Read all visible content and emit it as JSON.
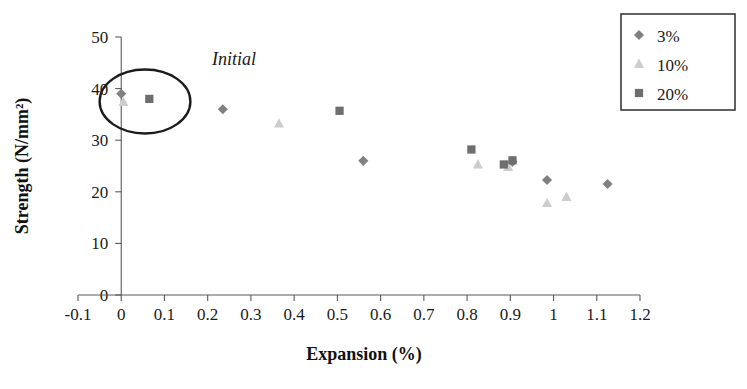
{
  "chart_data": {
    "type": "scatter",
    "title": "",
    "xlabel": "Expansion (%)",
    "ylabel": "Strength (N/mm²)",
    "xlim": [
      -0.1,
      1.2
    ],
    "ylim": [
      0,
      50
    ],
    "xticks": [
      "-0.1",
      "0",
      "0.1",
      "0.2",
      "0.3",
      "0.4",
      "0.5",
      "0.6",
      "0.7",
      "0.8",
      "0.9",
      "1",
      "1.1",
      "1.2"
    ],
    "xtick_values": [
      -0.1,
      0,
      0.1,
      0.2,
      0.3,
      0.4,
      0.5,
      0.6,
      0.7,
      0.8,
      0.9,
      1.0,
      1.1,
      1.2
    ],
    "yticks": [
      "0",
      "10",
      "20",
      "30",
      "40",
      "50"
    ],
    "ytick_values": [
      0,
      10,
      20,
      30,
      40,
      50
    ],
    "grid": false,
    "legend_position": "top-right",
    "series": [
      {
        "name": "3%",
        "marker": "diamond",
        "color": "#808080",
        "points": [
          {
            "x": 0.0,
            "y": 39.0
          },
          {
            "x": 0.235,
            "y": 36.0
          },
          {
            "x": 0.56,
            "y": 26.0
          },
          {
            "x": 0.905,
            "y": 25.8
          },
          {
            "x": 0.985,
            "y": 22.3
          },
          {
            "x": 1.125,
            "y": 21.5
          }
        ]
      },
      {
        "name": "10%",
        "marker": "triangle",
        "color": "#cdcdcd",
        "points": [
          {
            "x": 0.005,
            "y": 37.4
          },
          {
            "x": 0.365,
            "y": 33.2
          },
          {
            "x": 0.825,
            "y": 25.3
          },
          {
            "x": 0.895,
            "y": 24.8
          },
          {
            "x": 0.985,
            "y": 17.8
          },
          {
            "x": 1.03,
            "y": 19.0
          }
        ]
      },
      {
        "name": "20%",
        "marker": "square",
        "color": "#6e6e6e",
        "points": [
          {
            "x": 0.065,
            "y": 38.0
          },
          {
            "x": 0.505,
            "y": 35.7
          },
          {
            "x": 0.81,
            "y": 28.2
          },
          {
            "x": 0.885,
            "y": 25.3
          },
          {
            "x": 0.905,
            "y": 26.1
          }
        ]
      }
    ],
    "annotations": [
      {
        "text": "Initial",
        "type": "ellipse-callout",
        "ellipse_center": {
          "x": 0.055,
          "y": 37.5
        },
        "ellipse_rx": 0.105,
        "ellipse_ry": 6.2,
        "label_x": 0.21,
        "label_y": 44.5
      }
    ]
  },
  "legend": {
    "entries": [
      {
        "label": "3%",
        "marker": "diamond",
        "color": "#808080"
      },
      {
        "label": "10%",
        "marker": "triangle",
        "color": "#cdcdcd"
      },
      {
        "label": "20%",
        "marker": "square",
        "color": "#6e6e6e"
      }
    ]
  }
}
